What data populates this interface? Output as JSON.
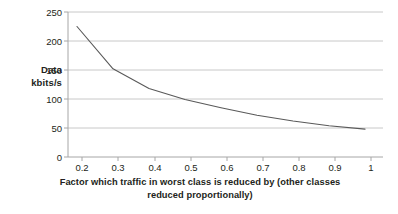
{
  "chart_data": {
    "type": "line",
    "title": "",
    "xlabel": "Factor which traffic in worst class is reduced by (other classes reduced proportionally)",
    "xlabel_line1": "Factor which traffic in worst class is reduced by (other classes",
    "xlabel_line2": "reduced proportionally)",
    "ylabel": "Data kbits/s",
    "ylabel_line1": "Data",
    "ylabel_line2": "kbits/s",
    "x": [
      0.2,
      0.3,
      0.4,
      0.5,
      0.6,
      0.7,
      0.8,
      0.9,
      1.0
    ],
    "values": [
      225,
      152,
      118,
      99,
      85,
      72,
      62,
      54,
      48
    ],
    "series": [
      {
        "name": "Data kbits/s",
        "values": [
          225,
          152,
          118,
          99,
          85,
          72,
          62,
          54,
          48
        ]
      }
    ],
    "xlim": [
      0.175,
      1.05
    ],
    "ylim": [
      0,
      250
    ],
    "xticks": [
      0.2,
      0.3,
      0.4,
      0.5,
      0.6,
      0.7,
      0.8,
      0.9,
      1.0
    ],
    "xtick_labels": [
      "0.2",
      "0.3",
      "0.4",
      "0.5",
      "0.6",
      "0.7",
      "0.8",
      "0.9",
      "1"
    ],
    "yticks": [
      0,
      50,
      100,
      150,
      200,
      250
    ],
    "ytick_labels": [
      "0",
      "50",
      "100",
      "150",
      "200",
      "250"
    ],
    "grid": "horizontal",
    "legend": "none",
    "line_color": "#595959",
    "grid_color": "#c8c8c8",
    "axis_color": "#a6a6a6",
    "background": "#ffffff"
  }
}
